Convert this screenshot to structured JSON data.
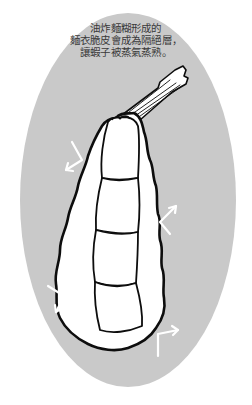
{
  "figure": {
    "caption_lines": [
      "油炸麵糊形成的",
      "麵衣脆皮會成為隔絕層，",
      "讓蝦子被蒸氣蒸熟。"
    ],
    "colors": {
      "background": "#ffffff",
      "oval_fill": "#c9c9c9",
      "outline": "#0d0d0d",
      "batter_fill": "#ffffff",
      "arrow": "#ffffff",
      "text": "#3a3a3a"
    },
    "elements": [
      {
        "name": "background-oval",
        "shape": "ellipse"
      },
      {
        "name": "shrimp-tail",
        "shape": "fan"
      },
      {
        "name": "batter-coating",
        "shape": "wavy-outline"
      },
      {
        "name": "shrimp-body",
        "segments": 4
      },
      {
        "name": "steam-arrows",
        "count": 4
      }
    ]
  }
}
